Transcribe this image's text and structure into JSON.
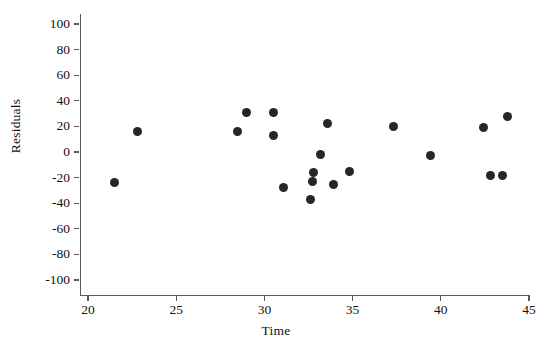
{
  "chart_data": {
    "type": "scatter",
    "title": "",
    "xlabel": "Time",
    "ylabel": "Residuals",
    "xlim": [
      19.0,
      45.9
    ],
    "ylim": [
      -110,
      107
    ],
    "xticks": [
      20,
      25,
      30,
      35,
      40,
      45
    ],
    "yticks": [
      100,
      80,
      60,
      40,
      20,
      0,
      -20,
      -40,
      -60,
      -80,
      -100
    ],
    "xtick_labels": [
      "20",
      "25",
      "30",
      "35",
      "40",
      "45"
    ],
    "ytick_labels": [
      "100",
      "80",
      "60",
      "40",
      "20",
      "0",
      "-20",
      "-40",
      "-60",
      "-80",
      "-100"
    ],
    "grid": false,
    "legend": false,
    "marker": "filled-circle",
    "marker_color": "#262626",
    "axis_color": "#5a5a5a",
    "background_color": "#ffffff",
    "points": [
      {
        "x": 21.5,
        "y": -24
      },
      {
        "x": 22.8,
        "y": 16
      },
      {
        "x": 28.5,
        "y": 16
      },
      {
        "x": 29.0,
        "y": 31
      },
      {
        "x": 30.5,
        "y": 31
      },
      {
        "x": 30.5,
        "y": 13
      },
      {
        "x": 31.1,
        "y": -28
      },
      {
        "x": 32.6,
        "y": -37
      },
      {
        "x": 32.7,
        "y": -23
      },
      {
        "x": 32.8,
        "y": -16
      },
      {
        "x": 33.2,
        "y": -2
      },
      {
        "x": 33.9,
        "y": -25
      },
      {
        "x": 34.8,
        "y": -15
      },
      {
        "x": 33.6,
        "y": 22
      },
      {
        "x": 37.3,
        "y": 20
      },
      {
        "x": 39.4,
        "y": -3
      },
      {
        "x": 42.4,
        "y": 19
      },
      {
        "x": 42.8,
        "y": -18
      },
      {
        "x": 43.5,
        "y": -18
      },
      {
        "x": 43.8,
        "y": 28
      }
    ]
  }
}
